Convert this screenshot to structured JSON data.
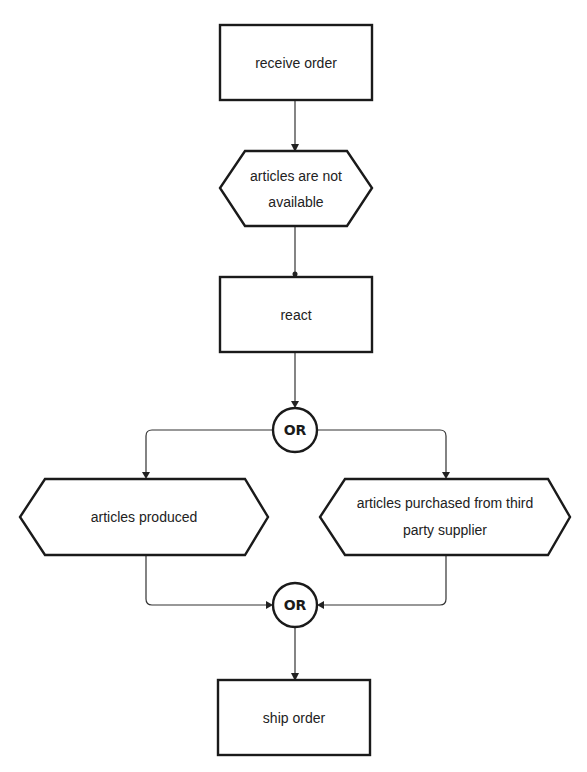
{
  "diagram": {
    "type": "event-driven process chain",
    "nodes": {
      "receive_order": {
        "kind": "function",
        "label": "receive order"
      },
      "articles_not_available": {
        "kind": "event",
        "label_line1": "articles are not",
        "label_line2": "available"
      },
      "react": {
        "kind": "function",
        "label": "react"
      },
      "or_split": {
        "kind": "connector",
        "label": "OR"
      },
      "articles_produced": {
        "kind": "event",
        "label": "articles produced"
      },
      "articles_purchased": {
        "kind": "event",
        "label_line1": "articles purchased from third",
        "label_line2": "party supplier"
      },
      "or_join": {
        "kind": "connector",
        "label": "OR"
      },
      "ship_order": {
        "kind": "function",
        "label": "ship order"
      }
    },
    "edges": [
      {
        "from": "receive order",
        "to": "articles are not available"
      },
      {
        "from": "articles are not available",
        "to": "react"
      },
      {
        "from": "react",
        "to": "OR (split)"
      },
      {
        "from": "OR (split)",
        "to": "articles produced"
      },
      {
        "from": "OR (split)",
        "to": "articles purchased from third party supplier"
      },
      {
        "from": "articles produced",
        "to": "OR (join)"
      },
      {
        "from": "articles purchased from third party supplier",
        "to": "OR (join)"
      },
      {
        "from": "OR (join)",
        "to": "ship order"
      }
    ]
  }
}
